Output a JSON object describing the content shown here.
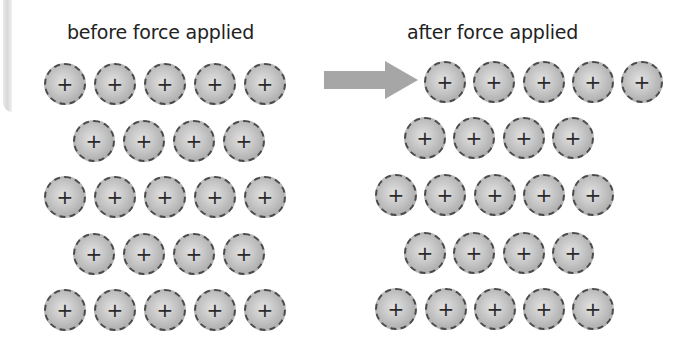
{
  "figure": {
    "title_before": "before force applied",
    "title_after": "after force applied",
    "ion_symbol": "+",
    "ion_icon": "positive-ion-icon",
    "arrow_icon": "right-arrow-icon",
    "colors": {
      "ion_border": "#4a4a4a",
      "ion_fill_light": "#e2e2e2",
      "ion_fill_dark": "#9c9c9c",
      "arrow": "#a6a6a6",
      "text": "#222222"
    }
  },
  "before_lattice": {
    "rows": [
      {
        "y": 83,
        "x": [
          64,
          114,
          164,
          214,
          264
        ]
      },
      {
        "y": 140,
        "x": [
          93,
          143,
          193,
          243
        ]
      },
      {
        "y": 196,
        "x": [
          64,
          114,
          164,
          214,
          264
        ]
      },
      {
        "y": 253,
        "x": [
          93,
          143,
          193,
          243
        ]
      },
      {
        "y": 309,
        "x": [
          64,
          114,
          164,
          214,
          264
        ]
      }
    ]
  },
  "after_lattice": {
    "rows": [
      {
        "y": 81,
        "x": [
          444,
          493,
          543,
          592,
          641
        ]
      },
      {
        "y": 137,
        "x": [
          424,
          473,
          523,
          572
        ]
      },
      {
        "y": 194,
        "x": [
          395,
          444,
          494,
          543,
          592
        ]
      },
      {
        "y": 252,
        "x": [
          424,
          473,
          523,
          572
        ]
      },
      {
        "y": 308,
        "x": [
          395,
          445,
          494,
          543,
          592
        ]
      }
    ]
  }
}
